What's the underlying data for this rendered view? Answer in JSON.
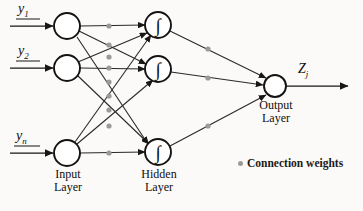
{
  "figure": {
    "type": "neural-network-diagram",
    "title": "",
    "background_color": "#fbfaf8",
    "stroke_color": "#181716",
    "weight_dot_color": "#9a9a9a"
  },
  "inputs": [
    {
      "id": "y1",
      "label": "y",
      "subscript": "1",
      "cx": 67,
      "cy": 26,
      "r": 13,
      "arrow_from_x": 10
    },
    {
      "id": "y2",
      "label": "y",
      "subscript": "2",
      "cx": 67,
      "cy": 68,
      "r": 13,
      "arrow_from_x": 10
    },
    {
      "id": "yn",
      "label": "y",
      "subscript": "n",
      "cx": 67,
      "cy": 153,
      "r": 13,
      "arrow_from_x": 10
    }
  ],
  "hidden": [
    {
      "id": "h1",
      "glyph": "∫",
      "cx": 158,
      "cy": 25,
      "r": 13
    },
    {
      "id": "h2",
      "glyph": "∫",
      "cx": 158,
      "cy": 69,
      "r": 13
    },
    {
      "id": "h3",
      "glyph": "∫",
      "cx": 158,
      "cy": 152,
      "r": 13
    }
  ],
  "output": {
    "id": "zj",
    "label": "Z",
    "subscript": "j",
    "cx": 275,
    "cy": 86,
    "r": 11,
    "arrow_to_x": 348
  },
  "layer_labels": {
    "input_line1": "Input",
    "input_line2": "Layer",
    "hidden_line1": "Hidden",
    "hidden_line2": "Layer",
    "output_line1": "Output",
    "output_line2": "Layer"
  },
  "legend": {
    "marker": "connection-weight-dot",
    "text": "Connection weights"
  },
  "connections": {
    "input_to_hidden_count": 9,
    "hidden_to_output_count": 3,
    "weight_dot_x_input_side": 109,
    "weight_dot_x_output_side": 208
  }
}
